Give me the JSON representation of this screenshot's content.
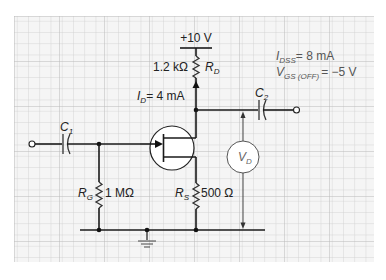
{
  "figure": {
    "background": "#ffffff",
    "grid": {
      "x": 14,
      "y": 16,
      "width": 360,
      "height": 246,
      "minor_spacing": 11.25,
      "major_every": 1,
      "color": "#c9c9c9",
      "paper_color": "#f4f4f4"
    }
  },
  "circuit": {
    "title": "JFET self-bias amplifier",
    "supply": {
      "label": "+10 V"
    },
    "drain_resistor": {
      "value": "1.2 kΩ",
      "name": "R",
      "subscript": "D"
    },
    "drain_current": {
      "name": "I",
      "subscript": "D",
      "value": "= 4 mA"
    },
    "input_capacitor": {
      "name": "C",
      "subscript": "1"
    },
    "output_capacitor": {
      "name": "C",
      "subscript": "2"
    },
    "gate_resistor": {
      "name": "R",
      "subscript": "G",
      "value": "1 MΩ"
    },
    "source_resistor": {
      "name": "R",
      "subscript": "S",
      "value": "500 Ω"
    },
    "voltmeter": {
      "name": "V",
      "subscript": "D"
    },
    "parameters": [
      {
        "name": "I",
        "subscript": "DSS",
        "value": "= 8 mA"
      },
      {
        "name": "V",
        "subscript": "GS (OFF)",
        "value": "= −5 V"
      }
    ],
    "ground": {
      "symbol": "ground-icon"
    }
  }
}
